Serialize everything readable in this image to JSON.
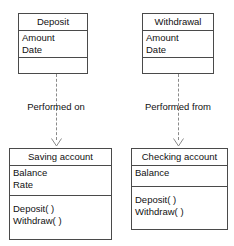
{
  "diagram": {
    "type": "uml-class-diagram",
    "background_color": "#ffffff",
    "line_color": "#4a4a4a",
    "dashed_line_color": "#8a8a8a",
    "text_color": "#111111"
  },
  "classes": [
    {
      "id": "deposit",
      "name": "Deposit",
      "attributes": [
        "Amount",
        "Date"
      ],
      "operations": []
    },
    {
      "id": "withdrawal",
      "name": "Withdrawal",
      "attributes": [
        "Amount",
        "Date"
      ],
      "operations": []
    },
    {
      "id": "saving-account",
      "name": "Saving account",
      "attributes": [
        "Balance",
        "Rate"
      ],
      "operations": [
        "Deposit( )",
        "Withdraw( )"
      ]
    },
    {
      "id": "checking-account",
      "name": "Checking account",
      "attributes": [
        "Balance"
      ],
      "operations": [
        "Deposit( )",
        "Withdraw( )"
      ]
    }
  ],
  "relationships": [
    {
      "id": "deposit-to-saving",
      "label": "Performed on",
      "from": "Deposit",
      "to": "Saving account",
      "style": "dashed",
      "arrow": "open"
    },
    {
      "id": "withdrawal-to-checking",
      "label": "Performed from",
      "from": "Withdrawal",
      "to": "Checking account",
      "style": "dashed",
      "arrow": "open"
    }
  ]
}
